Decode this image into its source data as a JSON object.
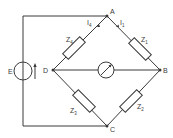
{
  "diagram": {
    "type": "Wheatstone bridge circuit",
    "nodes": {
      "A": "A",
      "B": "B",
      "C": "C",
      "D": "D"
    },
    "source": {
      "label": "E"
    },
    "impedances": {
      "z1": {
        "main": "Z",
        "sub": "1"
      },
      "z2": {
        "main": "Z",
        "sub": "2"
      },
      "z3": {
        "main": "Z",
        "sub": "3"
      },
      "z4": {
        "main": "Z",
        "sub": "4"
      }
    },
    "currents": {
      "i1": {
        "main": "I",
        "sub": "1"
      },
      "i4": {
        "main": "I",
        "sub": "4"
      }
    },
    "colors": {
      "line": "#3a3a3a",
      "background": "#ffffff"
    }
  }
}
